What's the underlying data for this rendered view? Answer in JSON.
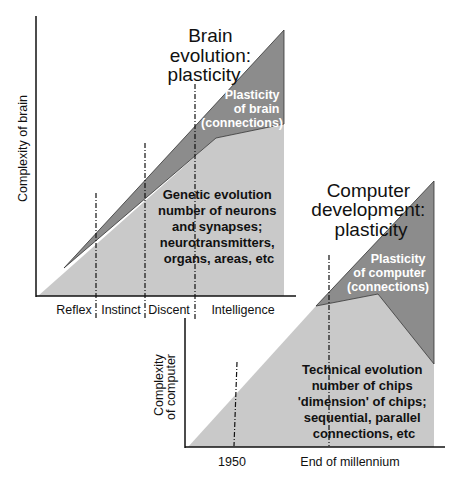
{
  "brain_panel": {
    "title": [
      "Brain",
      "evolution:",
      "plasticity"
    ],
    "y_axis_label": "Complexity of brain",
    "stages": [
      "Reflex",
      "Instinct",
      "Discent",
      "Intelligence"
    ],
    "plasticity_label": [
      "Plasticity",
      "of brain",
      "(connections)"
    ],
    "genetic_label": [
      "Genetic evolution",
      "number of neurons",
      "and synapses;",
      "neurotransmitters,",
      "organs, areas, etc"
    ]
  },
  "computer_panel": {
    "title": [
      "Computer",
      "development:",
      "plasticity"
    ],
    "y_axis_label": [
      "Complexity",
      "of computer"
    ],
    "x_ticks": [
      "1950",
      "End of millennium"
    ],
    "plasticity_label": [
      "Plasticity",
      "of computer",
      "(connections)"
    ],
    "technical_label": [
      "Technical evolution",
      "number of chips",
      "'dimension' of chips;",
      "sequential, parallel",
      "connections, etc"
    ]
  },
  "colors": {
    "light_fill": "#c8c8c8",
    "dark_fill": "#8a8a8a",
    "line": "#111111"
  }
}
